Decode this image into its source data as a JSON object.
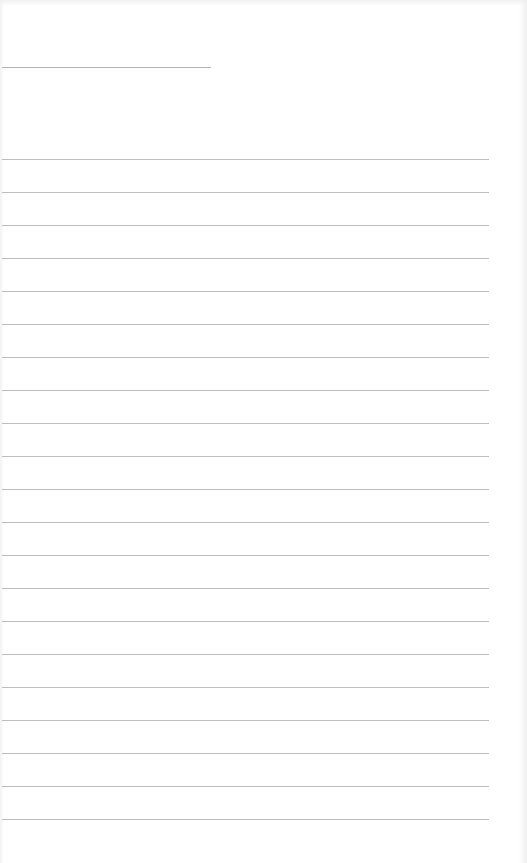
{
  "document": {
    "type": "ruled-paper",
    "title_line": {
      "x_start": 2,
      "x_end": 211,
      "y": 67,
      "color": "#b5b5b5"
    },
    "ruled_lines": {
      "count": 21,
      "x_start": 2,
      "x_end": 489,
      "first_y": 159,
      "spacing": 33,
      "color": "#bdbdbd"
    },
    "text_content": []
  }
}
